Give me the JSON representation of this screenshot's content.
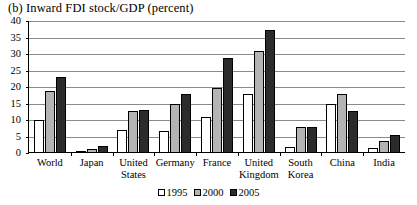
{
  "chart_data": {
    "type": "bar",
    "title": "(b) Inward FDI stock/GDP (percent)",
    "xlabel": "",
    "ylabel": "",
    "ylim": [
      0,
      40
    ],
    "yticks": [
      0,
      5,
      10,
      15,
      20,
      25,
      30,
      35,
      40
    ],
    "grid": true,
    "legend_position": "bottom",
    "categories": [
      "World",
      "Japan",
      "United States",
      "Germany",
      "France",
      "United Kingdom",
      "South Korea",
      "China",
      "India"
    ],
    "series": [
      {
        "name": "1995",
        "color": "#ffffff",
        "values": [
          10.0,
          0.3,
          7.0,
          6.8,
          11.0,
          17.8,
          1.8,
          15.0,
          1.5
        ]
      },
      {
        "name": "2000",
        "color": "#b4b4b4",
        "values": [
          18.8,
          1.1,
          12.8,
          14.8,
          19.8,
          30.8,
          7.8,
          17.8,
          3.5
        ]
      },
      {
        "name": "2005",
        "color": "#2b2b2b",
        "values": [
          22.9,
          2.2,
          13.0,
          17.8,
          28.8,
          37.4,
          8.0,
          12.8,
          5.5
        ]
      }
    ]
  },
  "legend": {
    "items": [
      {
        "label": "1995"
      },
      {
        "label": "2000"
      },
      {
        "label": "2005"
      }
    ]
  }
}
